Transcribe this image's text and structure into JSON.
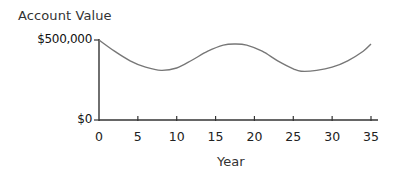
{
  "chart_data": {
    "type": "line",
    "title": "Account Value",
    "xlabel": "Year",
    "ylabel": "Account Value",
    "xlim": [
      0,
      35
    ],
    "ylim": [
      0,
      500000
    ],
    "x_ticks": [
      0,
      5,
      10,
      15,
      20,
      25,
      30,
      35
    ],
    "x_tick_labels": [
      "0",
      "5",
      "10",
      "15",
      "20",
      "25",
      "30",
      "35"
    ],
    "y_ticks": [
      0,
      500000
    ],
    "y_tick_labels": [
      "$0",
      "$500,000"
    ],
    "grid": false,
    "legend": null,
    "series": [
      {
        "name": "Account Value",
        "color": "#777777",
        "x": [
          0,
          2,
          4,
          6,
          8,
          10,
          12,
          14,
          16,
          17.5,
          19,
          21,
          23,
          25,
          26,
          28,
          30,
          32,
          34,
          35
        ],
        "values": [
          500000,
          430000,
          370000,
          330000,
          310000,
          325000,
          375000,
          430000,
          468000,
          475000,
          468000,
          430000,
          370000,
          320000,
          305000,
          310000,
          330000,
          370000,
          430000,
          475000
        ]
      }
    ]
  },
  "labels": {
    "title": "Account Value",
    "x_axis_title": "Year",
    "y_max": "$500,000",
    "y_min": "$0",
    "x_ticks": [
      "0",
      "5",
      "10",
      "15",
      "20",
      "25",
      "30",
      "35"
    ]
  }
}
